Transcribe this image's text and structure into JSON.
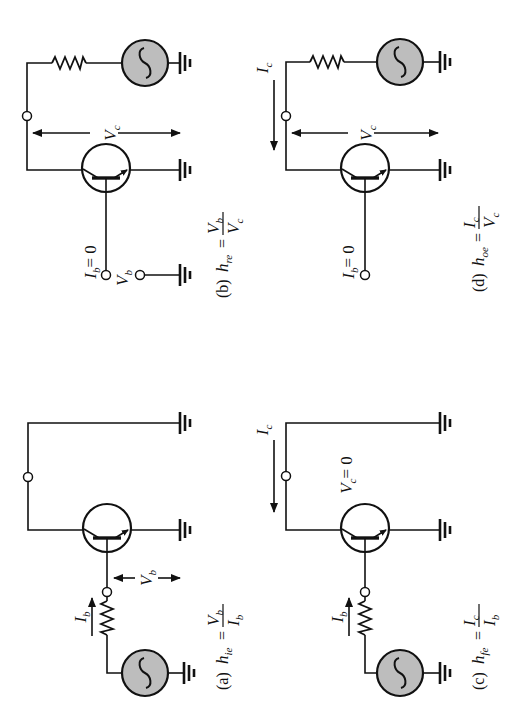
{
  "figure": {
    "orientation": "rotated-90-ccw",
    "source_fill": "#bdbdbd",
    "line_color": "#111111"
  },
  "panels": {
    "a": {
      "tag": "(a)",
      "param": "h",
      "param_sub": "ie",
      "eq": "=",
      "num": "V",
      "num_sub": "b",
      "den": "I",
      "den_sub": "b",
      "current_label": "I",
      "current_sub": "b",
      "voltage_label": "V",
      "voltage_sub": "b",
      "description": "Input impedance, output shorted"
    },
    "b": {
      "tag": "(b)",
      "param": "h",
      "param_sub": "re",
      "eq": "=",
      "num": "V",
      "num_sub": "b",
      "den": "V",
      "den_sub": "c",
      "condition": "I",
      "condition_sub": "b",
      "condition_val": "= 0",
      "voltage_b_label": "V",
      "voltage_b_sub": "b",
      "voltage_c_label": "V",
      "voltage_c_sub": "c",
      "description": "Reverse voltage ratio, input open"
    },
    "c": {
      "tag": "(c)",
      "param": "h",
      "param_sub": "fe",
      "eq": "=",
      "num": "I",
      "num_sub": "c",
      "den": "I",
      "den_sub": "b",
      "current_b_label": "I",
      "current_b_sub": "b",
      "current_c_label": "I",
      "current_c_sub": "c",
      "condition": "V",
      "condition_sub": "c",
      "condition_val": "= 0",
      "description": "Forward current gain, output shorted"
    },
    "d": {
      "tag": "(d)",
      "param": "h",
      "param_sub": "oe",
      "eq": "=",
      "num": "I",
      "num_sub": "c",
      "den": "V",
      "den_sub": "c",
      "current_c_label": "I",
      "current_c_sub": "c",
      "voltage_c_label": "V",
      "voltage_c_sub": "c",
      "condition": "I",
      "condition_sub": "b",
      "condition_val": "= 0",
      "description": "Output admittance, input open"
    }
  }
}
